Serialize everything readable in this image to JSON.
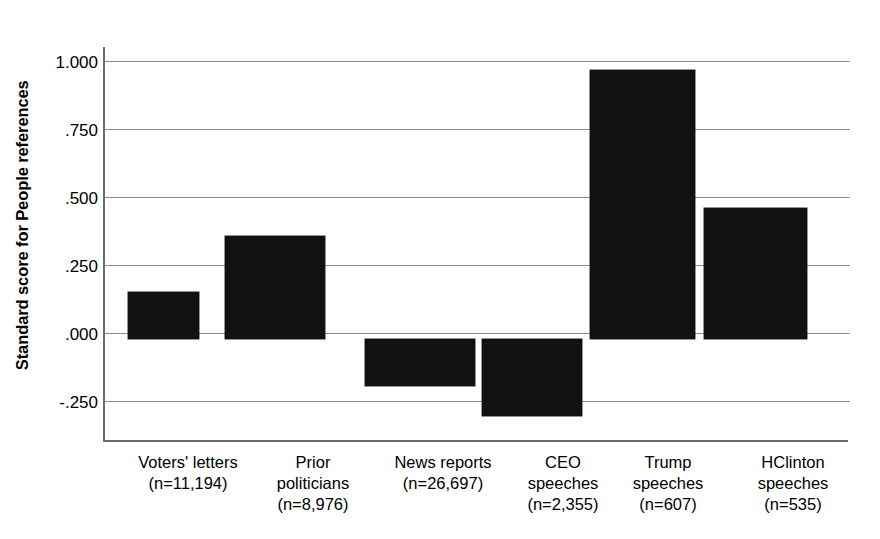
{
  "chart_data": {
    "type": "bar",
    "title": "",
    "xlabel": "",
    "ylabel": "Standard score for People references",
    "ylabel_bold_word": "People",
    "categories": [
      "Voters' letters\n(n=11,194)",
      "Prior politicians\n(n=8,976)",
      "News reports\n(n=26,697)",
      "CEO speeches\n(n=2,355)",
      "Trump speeches\n(n=607)",
      "HClinton speeches\n(n=535)"
    ],
    "category_lines": [
      [
        "Voters' letters",
        "(n=11,194)"
      ],
      [
        "Prior",
        "politicians",
        "(n=8,976)"
      ],
      [
        "News reports",
        "(n=26,697)"
      ],
      [
        "CEO",
        "speeches",
        "(n=2,355)"
      ],
      [
        "Trump",
        "speeches",
        "(n=607)"
      ],
      [
        "HClinton",
        "speeches",
        "(n=535)"
      ]
    ],
    "sample_sizes": [
      11194,
      8976,
      26697,
      2355,
      607,
      535
    ],
    "values": [
      0.17,
      0.375,
      -0.17,
      -0.28,
      0.98,
      0.475
    ],
    "ylim": [
      -0.375,
      1.0625
    ],
    "yticks": [
      1.0,
      0.75,
      0.5,
      0.25,
      0.0,
      -0.25
    ],
    "ytick_labels": [
      "1.000",
      ".750",
      ".500",
      ".250",
      ".000",
      "-.250"
    ],
    "grid": true,
    "legend": "none",
    "bar_color": "#111111",
    "axis_color": "#6b6b6b",
    "gridline_color": "#8a8a8a",
    "background": "#ffffff"
  },
  "geometry": {
    "bar_left_pct": [
      3.1,
      16.1,
      34.9,
      50.6,
      65.1,
      80.4
    ],
    "bar_width_pct": [
      9.5,
      13.4,
      14.8,
      13.4,
      14.1,
      13.8
    ],
    "label_left_px": [
      10,
      145,
      265,
      395,
      500,
      620
    ],
    "label_width_px": [
      150,
      130,
      150,
      130,
      130,
      140
    ]
  }
}
